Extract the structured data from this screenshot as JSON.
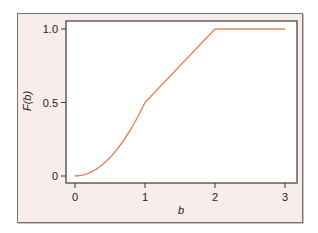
{
  "chart_data": {
    "type": "line",
    "title": "",
    "xlabel": "b",
    "ylabel": "F(b)",
    "xlim": [
      -0.13,
      3.17
    ],
    "ylim": [
      -0.07,
      1.1
    ],
    "x_ticks": [
      0,
      1,
      2,
      3
    ],
    "x_tick_labels": [
      "0",
      "1",
      "2",
      "3"
    ],
    "y_ticks": [
      0,
      0.5,
      1.0
    ],
    "y_tick_labels": [
      "0",
      "0.5",
      "1.0"
    ],
    "grid": false,
    "legend": null,
    "series": [
      {
        "name": "F(b)",
        "color": "#e8845a",
        "x": [
          0,
          0.1,
          0.2,
          0.3,
          0.4,
          0.5,
          0.6,
          0.7,
          0.8,
          0.9,
          1.0,
          1.5,
          2.0,
          3.0
        ],
        "y": [
          0,
          0.005,
          0.02,
          0.045,
          0.08,
          0.125,
          0.18,
          0.245,
          0.32,
          0.405,
          0.5,
          0.75,
          1.0,
          1.0
        ]
      }
    ]
  },
  "colors": {
    "panel_bg": "#f7eeec",
    "plot_bg": "#ffffff",
    "frame": "#3a3636",
    "line": "#e8845a"
  }
}
